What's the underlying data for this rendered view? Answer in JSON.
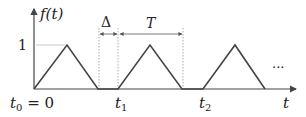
{
  "diagram": {
    "y_axis_label": "f(t)",
    "x_axis_label": "t",
    "level_label": "1",
    "delta_label": "Δ",
    "period_label": "T",
    "ellipsis": "···",
    "ticks": [
      {
        "base": "t",
        "sub": "0",
        "suffix": " = 0"
      },
      {
        "base": "t",
        "sub": "1",
        "suffix": ""
      },
      {
        "base": "t",
        "sub": "2",
        "suffix": ""
      }
    ],
    "colors": {
      "line": "#444444",
      "guide": "#aaaaaa"
    }
  }
}
